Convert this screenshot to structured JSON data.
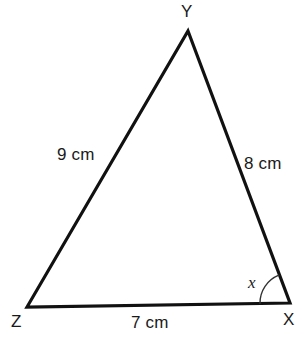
{
  "figure": {
    "kind": "triangle-geometry-diagram",
    "background_color": "#ffffff",
    "stroke_color": "#111111",
    "text_color": "#1a1a1a"
  },
  "vertices": [
    {
      "id": "Y",
      "label": "Y",
      "x": 188,
      "y": 31
    },
    {
      "id": "Z",
      "label": "Z",
      "x": 27,
      "y": 307
    },
    {
      "id": "X",
      "label": "X",
      "x": 290,
      "y": 303
    }
  ],
  "sides": [
    {
      "id": "ZY",
      "label": "9 cm",
      "length": 9,
      "unit": "cm"
    },
    {
      "id": "YX",
      "label": "8 cm",
      "length": 8,
      "unit": "cm"
    },
    {
      "id": "ZX",
      "label": "7 cm",
      "length": 7,
      "unit": "cm"
    }
  ],
  "angles": [
    {
      "id": "at-X",
      "label": "x",
      "at_vertex": "X",
      "marker": "single-arc",
      "arc_radius": 30
    }
  ]
}
